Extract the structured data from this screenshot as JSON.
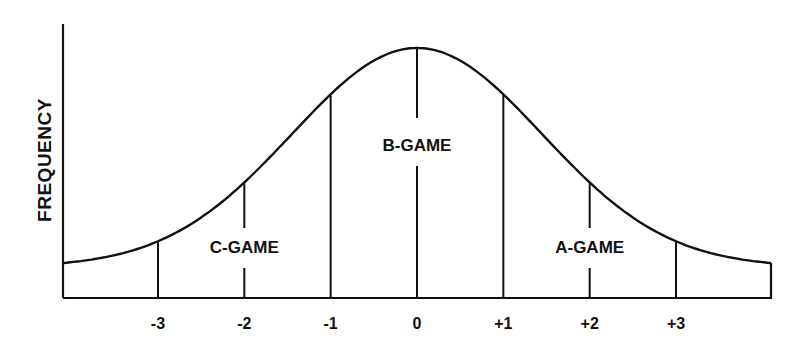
{
  "diagram": {
    "title": "",
    "ylabel": "FREQUENCY",
    "xlabel": "",
    "line_color": "#111111",
    "text_color": "#111111",
    "background": "#ffffff",
    "distribution": "normal",
    "x_range": [
      -4.1,
      4.1
    ],
    "tick_labels": [
      {
        "value": -3,
        "label": "-3"
      },
      {
        "value": -2,
        "label": "-2"
      },
      {
        "value": -1,
        "label": "-1"
      },
      {
        "value": 0,
        "label": "0"
      },
      {
        "value": 1,
        "label": "+1"
      },
      {
        "value": 2,
        "label": "+2"
      },
      {
        "value": 3,
        "label": "+3"
      }
    ],
    "zones": [
      {
        "name": "c-game",
        "label": "C-GAME",
        "center": -2
      },
      {
        "name": "b-game",
        "label": "B-GAME",
        "center": 0
      },
      {
        "name": "a-game",
        "label": "A-GAME",
        "center": 2
      }
    ]
  }
}
